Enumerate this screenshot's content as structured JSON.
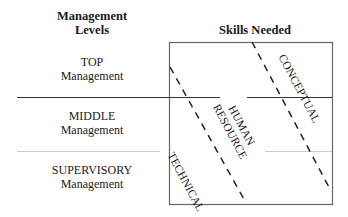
{
  "headers": {
    "levels": "Management Levels",
    "levels_line1": "Management",
    "levels_line2": "Levels",
    "skills": "Skills Needed"
  },
  "levels": [
    {
      "line1": "TOP",
      "line2": "Management"
    },
    {
      "line1": "MIDDLE",
      "line2": "Management"
    },
    {
      "line1": "SUPERVISORY",
      "line2": "Management"
    }
  ],
  "skills": [
    {
      "label": "TECHNICAL"
    },
    {
      "label": "HUMAN",
      "label2": "RESOURCE"
    },
    {
      "label": "CONCEPTUAL"
    }
  ],
  "colors": {
    "line": "#555555",
    "divider_light": "#bbbbbb",
    "text": "#1a1a1a"
  }
}
